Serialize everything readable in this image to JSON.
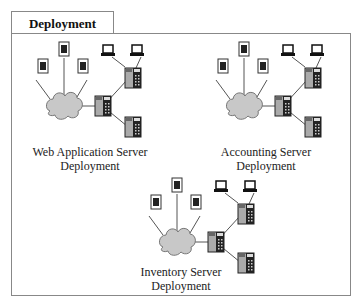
{
  "title": "Deployment",
  "groups": [
    {
      "name": "web-application-server-deployment",
      "line1": "Web Application Server",
      "line2": "Deployment",
      "ox": 0,
      "oy": 0
    },
    {
      "name": "accounting-server-deployment",
      "line1": "Accounting Server",
      "line2": "Deployment",
      "ox": 180,
      "oy": 0
    },
    {
      "name": "inventory-server-deployment",
      "line1": "Inventory Server",
      "line2": "Deployment",
      "ox": 98,
      "oy": 136
    }
  ],
  "icons": {
    "document": "document-icon",
    "computer": "computer-icon",
    "server": "server-icon",
    "network": "network-cloud-icon"
  },
  "colors": {
    "border": "#888888",
    "cloud": "#c8c8c8",
    "server_dark": "#222222",
    "server_light": "#aaaaaa"
  }
}
